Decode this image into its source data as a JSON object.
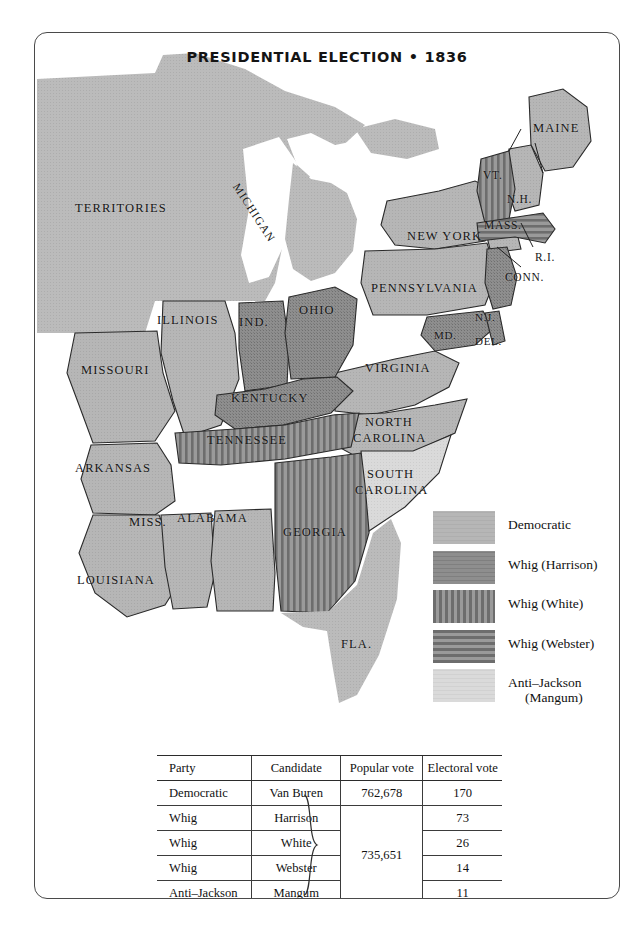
{
  "title": "PRESIDENTIAL ELECTION • 1836",
  "colors": {
    "democratic": "#b4b4b4",
    "whig_harrison": "#8c8c8c",
    "whig_white": "#8c8c8c",
    "whig_webster": "#8c8c8c",
    "anti_jackson": "#d8d8d8",
    "territory": "#b9b9b9",
    "water": "#ffffff",
    "stroke": "#2a2a2a"
  },
  "legend": {
    "items": [
      {
        "label": "Democratic",
        "pattern": "solid-light",
        "label2": ""
      },
      {
        "label": "Whig (Harrison)",
        "pattern": "solid-dark",
        "label2": ""
      },
      {
        "label": "Whig  (White)",
        "pattern": "vertical-stripes",
        "label2": ""
      },
      {
        "label": "Whig (Webster)",
        "pattern": "horizontal-stripes",
        "label2": ""
      },
      {
        "label": "Anti–Jackson",
        "pattern": "solid-pale",
        "label2": "(Mangum)"
      }
    ]
  },
  "map_labels": [
    {
      "name": "TERRITORIES",
      "text": "TERRITORIES"
    },
    {
      "name": "MICHIGAN",
      "text": "MICHIGAN"
    },
    {
      "name": "MAINE",
      "text": "MAINE"
    },
    {
      "name": "VT",
      "text": "VT."
    },
    {
      "name": "NH",
      "text": "N.H."
    },
    {
      "name": "MASS",
      "text": "MASS."
    },
    {
      "name": "RI",
      "text": "R.I."
    },
    {
      "name": "CONN",
      "text": "CONN."
    },
    {
      "name": "NEW-YORK",
      "text": "NEW YORK"
    },
    {
      "name": "PENNSYLVANIA",
      "text": "PENNSYLVANIA"
    },
    {
      "name": "NJ",
      "text": "N.J."
    },
    {
      "name": "MD",
      "text": "MD."
    },
    {
      "name": "DEL",
      "text": "DEL."
    },
    {
      "name": "OHIO",
      "text": "OHIO"
    },
    {
      "name": "IND",
      "text": "IND."
    },
    {
      "name": "ILLINOIS",
      "text": "ILLINOIS"
    },
    {
      "name": "MISSOURI",
      "text": "MISSOURI"
    },
    {
      "name": "KENTUCKY",
      "text": "KENTUCKY"
    },
    {
      "name": "VIRGINIA",
      "text": "VIRGINIA"
    },
    {
      "name": "NORTH-CAROLINA1",
      "text": "NORTH"
    },
    {
      "name": "NORTH-CAROLINA2",
      "text": "CAROLINA"
    },
    {
      "name": "SOUTH-CAROLINA1",
      "text": "SOUTH"
    },
    {
      "name": "SOUTH-CAROLINA2",
      "text": "CAROLINA"
    },
    {
      "name": "TENNESSEE",
      "text": "TENNESSEE"
    },
    {
      "name": "ARKANSAS",
      "text": "ARKANSAS"
    },
    {
      "name": "MISS",
      "text": "MISS."
    },
    {
      "name": "ALABAMA",
      "text": "ALABAMA"
    },
    {
      "name": "GEORGIA",
      "text": "GEORGIA"
    },
    {
      "name": "LOUISIANA",
      "text": "LOUISIANA"
    },
    {
      "name": "FLA",
      "text": "FLA."
    }
  ],
  "table": {
    "headers": [
      "Party",
      "Candidate",
      "Popular vote",
      "Electoral vote"
    ],
    "rows": [
      {
        "party": "Democratic",
        "candidate": "Van Buren",
        "popular": "762,678",
        "electoral": "170"
      },
      {
        "party": "Whig",
        "candidate": "Harrison",
        "popular": "",
        "electoral": "73"
      },
      {
        "party": "Whig",
        "candidate": "White",
        "popular": "735,651",
        "electoral": "26"
      },
      {
        "party": "Whig",
        "candidate": "Webster",
        "popular": "",
        "electoral": "14"
      },
      {
        "party": "Anti–Jackson",
        "candidate": "Mangum",
        "popular": "",
        "electoral": "11"
      }
    ],
    "grouped_popular_vote": "735,651"
  }
}
